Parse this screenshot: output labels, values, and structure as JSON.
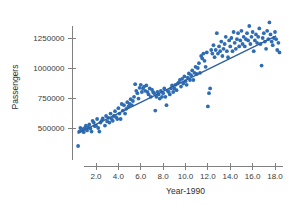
{
  "chart_data": {
    "type": "scatter",
    "title": "",
    "xlabel": "Year-1990",
    "ylabel": "Passengers",
    "xlim": [
      0,
      18.8
    ],
    "ylim": [
      300000,
      1420000
    ],
    "grid": false,
    "legend": null,
    "x_ticks": [
      "2.0",
      "4.0",
      "6.0",
      "8.0",
      "10.0",
      "12.0",
      "14.0",
      "16.0",
      "18.0"
    ],
    "x_tick_values": [
      2.0,
      4.0,
      6.0,
      8.0,
      10.0,
      12.0,
      14.0,
      16.0,
      18.0
    ],
    "y_ticks": [
      "500000",
      "750000",
      "1000000",
      "1250000"
    ],
    "y_tick_values": [
      500000,
      750000,
      1000000,
      1250000
    ],
    "point_color": "#2e6db4",
    "line_color": "#2e5f9e",
    "axis_color": "#808080",
    "trend_line": {
      "label": "least-squares fit",
      "x_start": 0.35,
      "y_start": 455000,
      "x_end": 18.1,
      "y_end": 1268000
    },
    "x": [
      0.4,
      0.5,
      0.6,
      0.7,
      0.8,
      0.9,
      1.0,
      1.1,
      1.2,
      1.3,
      1.4,
      1.5,
      1.6,
      1.7,
      1.8,
      1.9,
      2.0,
      2.1,
      2.2,
      2.3,
      2.4,
      2.5,
      2.6,
      2.8,
      2.9,
      3.0,
      3.1,
      3.2,
      3.3,
      3.4,
      3.5,
      3.6,
      3.7,
      3.8,
      3.9,
      4.0,
      4.1,
      4.2,
      4.3,
      4.4,
      4.5,
      4.6,
      4.7,
      4.8,
      4.9,
      5.0,
      5.1,
      5.2,
      5.3,
      5.4,
      5.5,
      5.6,
      5.7,
      5.8,
      5.9,
      6.0,
      6.1,
      6.2,
      6.3,
      6.4,
      6.5,
      6.6,
      6.7,
      6.8,
      6.9,
      7.0,
      7.1,
      7.2,
      7.3,
      7.4,
      7.5,
      7.6,
      7.7,
      7.8,
      7.9,
      8.0,
      8.1,
      8.2,
      8.3,
      8.4,
      8.5,
      8.6,
      8.7,
      8.8,
      8.9,
      9.0,
      9.1,
      9.2,
      9.3,
      9.4,
      9.5,
      9.6,
      9.7,
      9.8,
      9.9,
      10.0,
      10.1,
      10.2,
      10.3,
      10.4,
      10.5,
      10.6,
      10.7,
      10.8,
      10.9,
      11.0,
      11.1,
      11.2,
      11.3,
      11.4,
      11.5,
      11.6,
      11.7,
      11.8,
      11.9,
      12.0,
      12.1,
      12.2,
      12.3,
      12.4,
      12.5,
      12.6,
      12.7,
      12.8,
      12.9,
      13.0,
      13.1,
      13.2,
      13.3,
      13.4,
      13.5,
      13.6,
      13.7,
      13.8,
      13.9,
      14.0,
      14.1,
      14.2,
      14.3,
      14.4,
      14.5,
      14.6,
      14.7,
      14.8,
      14.9,
      15.0,
      15.1,
      15.2,
      15.3,
      15.4,
      15.5,
      15.6,
      15.7,
      15.8,
      15.9,
      16.0,
      16.1,
      16.2,
      16.3,
      16.4,
      16.5,
      16.6,
      16.7,
      16.8,
      16.9,
      17.0,
      17.1,
      17.2,
      17.3,
      17.4,
      17.5,
      17.6,
      17.7,
      17.8,
      17.9,
      18.0,
      18.1,
      18.2,
      18.3,
      18.4
    ],
    "y": [
      350000,
      470000,
      500000,
      480000,
      490000,
      465000,
      500000,
      520000,
      480000,
      505000,
      530000,
      495000,
      470000,
      560000,
      545000,
      515000,
      520000,
      575000,
      500000,
      470000,
      545000,
      560000,
      580000,
      520000,
      600000,
      555000,
      585000,
      545000,
      620000,
      575000,
      560000,
      600000,
      640000,
      590000,
      575000,
      665000,
      620000,
      575000,
      700000,
      645000,
      690000,
      620000,
      660000,
      715000,
      680000,
      700000,
      740000,
      690000,
      725000,
      760000,
      865000,
      810000,
      790000,
      745000,
      835000,
      860000,
      800000,
      830000,
      845000,
      810000,
      855000,
      800000,
      780000,
      830000,
      760000,
      820000,
      800000,
      790000,
      645000,
      760000,
      800000,
      780000,
      745000,
      810000,
      760000,
      790000,
      830000,
      760000,
      690000,
      810000,
      800000,
      780000,
      830000,
      855000,
      800000,
      830000,
      860000,
      815000,
      870000,
      880000,
      900000,
      845000,
      910000,
      870000,
      930000,
      890000,
      860000,
      920000,
      955000,
      900000,
      940000,
      980000,
      900000,
      960000,
      1010000,
      950000,
      1000000,
      1040000,
      960000,
      1100000,
      1080000,
      1120000,
      1060000,
      1010000,
      1130000,
      680000,
      790000,
      830000,
      1150000,
      1120000,
      1190000,
      1090000,
      1150000,
      1290000,
      1120000,
      1180000,
      1140000,
      1220000,
      1100000,
      1160000,
      1200000,
      1260000,
      1140000,
      1090000,
      1230000,
      1180000,
      1250000,
      1140000,
      1300000,
      1210000,
      1160000,
      1240000,
      1290000,
      1180000,
      1230000,
      1310000,
      1200000,
      1260000,
      1180000,
      1240000,
      1290000,
      1230000,
      1350000,
      1200000,
      1260000,
      1300000,
      1140000,
      1230000,
      1280000,
      1210000,
      1260000,
      1330000,
      1200000,
      1020000,
      1250000,
      1290000,
      1220000,
      1160000,
      1310000,
      1240000,
      1380000,
      1280000,
      1220000,
      1190000,
      1250000,
      1300000,
      1240000,
      1150000,
      1210000,
      1130000
    ]
  },
  "ghost_header": ""
}
